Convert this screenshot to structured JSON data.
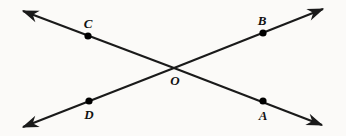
{
  "figure": {
    "type": "geometry-diagram",
    "background_color": "#fbfaf8",
    "stroke_color": "#1a1a1a",
    "point_color": "#000000",
    "canvas": {
      "width": 346,
      "height": 136
    },
    "lines": [
      {
        "name": "line-CA",
        "from_arrow": {
          "x": 23,
          "y": 11
        },
        "to_arrow": {
          "x": 322,
          "y": 125
        },
        "passes_through": [
          "C",
          "O",
          "A"
        ]
      },
      {
        "name": "line-DB",
        "from_arrow": {
          "x": 23,
          "y": 127
        },
        "to_arrow": {
          "x": 323,
          "y": 9
        },
        "passes_through": [
          "D",
          "O",
          "B"
        ]
      }
    ],
    "points": [
      {
        "id": "C",
        "label": "C",
        "dot": {
          "x": 88,
          "y": 36
        },
        "label_pos": {
          "x": 88,
          "y": 23
        },
        "dot_r": 3.6
      },
      {
        "id": "B",
        "label": "B",
        "dot": {
          "x": 263,
          "y": 33
        },
        "label_pos": {
          "x": 262,
          "y": 20
        },
        "dot_r": 3.6
      },
      {
        "id": "O",
        "label": "O",
        "dot": {
          "x": 174,
          "y": 68
        },
        "label_pos": {
          "x": 175,
          "y": 80
        },
        "dot_r": 0
      },
      {
        "id": "D",
        "label": "D",
        "dot": {
          "x": 89,
          "y": 101
        },
        "label_pos": {
          "x": 89,
          "y": 114
        },
        "dot_r": 3.6
      },
      {
        "id": "A",
        "label": "A",
        "dot": {
          "x": 263,
          "y": 101
        },
        "label_pos": {
          "x": 263,
          "y": 115
        },
        "dot_r": 3.6
      }
    ]
  }
}
